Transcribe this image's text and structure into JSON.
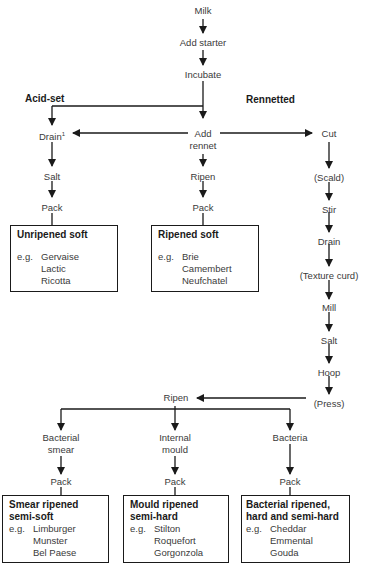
{
  "diagram": {
    "type": "flowchart",
    "branch_headers": {
      "acid_set": "Acid-set",
      "rennetted": "Rennetted"
    },
    "steps": {
      "milk": "Milk",
      "add_starter": "Add starter",
      "incubate": "Incubate",
      "drain_acid": "Drain",
      "drain_footnote": "1",
      "add_rennet_1": "Add",
      "add_rennet_2": "rennet",
      "cut": "Cut",
      "salt_acid": "Salt",
      "pack_acid": "Pack",
      "ripen_soft": "Ripen",
      "pack_soft": "Pack",
      "scald": "(Scald)",
      "stir": "Stir",
      "drain_curd": "Drain",
      "texture_curd": "(Texture curd)",
      "mill": "Mill",
      "salt_curd": "Salt",
      "hoop": "Hoop",
      "press": "(Press)",
      "ripen_main": "Ripen",
      "bacterial_smear_1": "Bacterial",
      "bacterial_smear_2": "smear",
      "internal_mould_1": "Internal",
      "internal_mould_2": "mould",
      "bacteria": "Bacteria",
      "pack_smear": "Pack",
      "pack_mould": "Pack",
      "pack_bacteria": "Pack"
    },
    "outcomes": [
      {
        "title": "Unripened soft",
        "eg": "e.g.",
        "examples": [
          "Gervaise",
          "Lactic",
          "Ricotta"
        ]
      },
      {
        "title": "Ripened soft",
        "eg": "e.g.",
        "examples": [
          "Brie",
          "Camembert",
          "Neufchatel"
        ]
      },
      {
        "title_1": "Smear ripened",
        "title_2": "semi-soft",
        "eg": "e.g.",
        "examples": [
          "Limburger",
          "Munster",
          "Bel Paese"
        ]
      },
      {
        "title_1": "Mould ripened",
        "title_2": "semi-hard",
        "eg": "e.g.",
        "examples": [
          "Stilton",
          "Roquefort",
          "Gorgonzola"
        ]
      },
      {
        "title_1": "Bacterial ripened,",
        "title_2": "hard and semi-hard",
        "eg": "e.g.",
        "examples": [
          "Cheddar",
          "Emmental",
          "Gouda"
        ]
      }
    ]
  }
}
